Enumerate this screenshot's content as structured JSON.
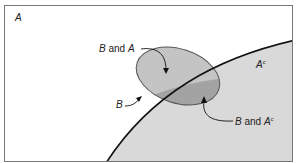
{
  "diagram": {
    "type": "venn",
    "regions": {
      "A": {
        "label": "A"
      },
      "A_complement": {
        "label": "A",
        "superscript": "c"
      }
    },
    "labels": {
      "b_and_a": {
        "pre": "B",
        "mid": " and ",
        "post": "A"
      },
      "b": {
        "text": "B"
      },
      "b_and_ac": {
        "pre": "B",
        "mid": " and ",
        "post": "A",
        "superscript": "c"
      }
    },
    "colors": {
      "background": "#ffffff",
      "a_complement_fill": "#d9d9d9",
      "ellipse_fill": "#bdbdbd",
      "overlap_fill": "#9e9e9e",
      "frame_stroke": "#777777",
      "curve_stroke": "#111111",
      "ellipse_stroke": "#555555"
    }
  }
}
